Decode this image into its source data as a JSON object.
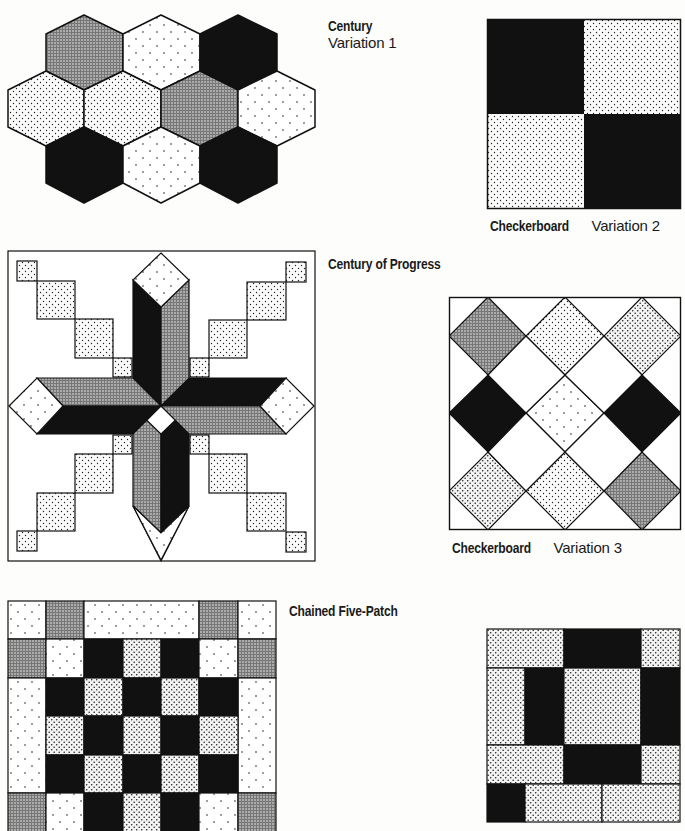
{
  "page": {
    "type": "quilt-pattern-reference-page",
    "background": "#fdfdfb",
    "ink": "#111111"
  },
  "patterns": [
    {
      "id": "century-variation-1",
      "name": "Century",
      "variation": "Variation 1",
      "shape": "hexagon-grid",
      "fills": [
        [
          "medium",
          "light",
          "dark"
        ],
        [
          "fine",
          "fine",
          "medium",
          "light"
        ],
        [
          "dark",
          "light",
          "dark"
        ]
      ]
    },
    {
      "id": "checkerboard-variation-2",
      "name": "Checkerboard",
      "variation": "Variation 2",
      "shape": "2x2-grid",
      "fills": [
        [
          "dark",
          "fine"
        ],
        [
          "fine",
          "dark"
        ]
      ]
    },
    {
      "id": "century-of-progress",
      "name": "Century of Progress",
      "variation": "",
      "shape": "eight-point-star-with-stepped-squares"
    },
    {
      "id": "checkerboard-variation-3",
      "name": "Checkerboard",
      "variation": "Variation 3",
      "shape": "on-point-diamond-grid",
      "fills": [
        [
          "medium",
          "fine",
          "fine"
        ],
        [
          "dark",
          "light",
          "dark"
        ],
        [
          "fine",
          "fine",
          "medium"
        ]
      ]
    },
    {
      "id": "chained-five-patch",
      "name": "Chained Five-Patch",
      "variation": "",
      "shape": "7x7-grid"
    },
    {
      "id": "unnamed-block-bottom-right",
      "name": "",
      "variation": "",
      "shape": "rail-and-square-block"
    }
  ]
}
